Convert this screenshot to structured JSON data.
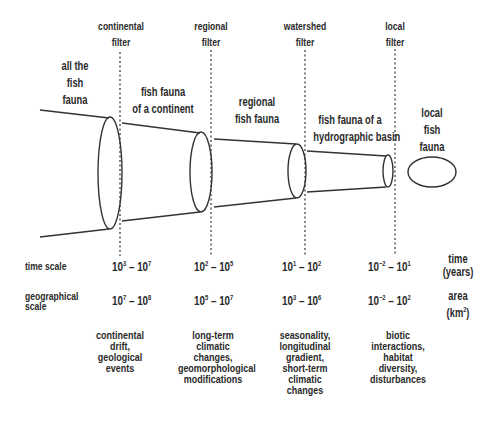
{
  "filters": [
    {
      "id": "continental",
      "label_line1": "continental",
      "label_line2": "filter"
    },
    {
      "id": "regional",
      "label_line1": "regional",
      "label_line2": "filter"
    },
    {
      "id": "watershed",
      "label_line1": "watershed",
      "label_line2": "filter"
    },
    {
      "id": "local",
      "label_line1": "local",
      "label_line2": "filter"
    }
  ],
  "faunas": [
    {
      "lines": [
        "all the",
        "fish",
        "fauna"
      ]
    },
    {
      "lines": [
        "fish fauna",
        "of a continent"
      ]
    },
    {
      "lines": [
        "regional",
        "fish fauna"
      ]
    },
    {
      "lines": [
        "fish fauna of a",
        "hydrographic basin"
      ]
    },
    {
      "lines": [
        "local",
        "fish",
        "fauna"
      ]
    }
  ],
  "rows": {
    "time_scale": {
      "label": "time scale",
      "unit_line1": "time",
      "unit_line2": "(years)",
      "values": [
        {
          "a_base": "10",
          "a_exp": "3",
          "b_base": "10",
          "b_exp": "7"
        },
        {
          "a_base": "10",
          "a_exp": "2",
          "b_base": "10",
          "b_exp": "5"
        },
        {
          "a_base": "10",
          "a_exp": "1",
          "b_base": "10",
          "b_exp": "2"
        },
        {
          "a_base": "10",
          "a_exp": "−2",
          "b_base": "10",
          "b_exp": "1"
        }
      ]
    },
    "geographical_scale": {
      "label_line1": "geographical",
      "label_line2": "scale",
      "unit_line1": "area",
      "unit_line2": "(km",
      "unit_exp": "2",
      "unit_close": ")",
      "values": [
        {
          "a_base": "10",
          "a_exp": "7",
          "b_base": "10",
          "b_exp": "8"
        },
        {
          "a_base": "10",
          "a_exp": "5",
          "b_base": "10",
          "b_exp": "7"
        },
        {
          "a_base": "10",
          "a_exp": "3",
          "b_base": "10",
          "b_exp": "6"
        },
        {
          "a_base": "10",
          "a_exp": "−2",
          "b_base": "10",
          "b_exp": "2"
        }
      ]
    }
  },
  "drivers": [
    {
      "lines": [
        "continental",
        "drift,",
        "geological",
        "events"
      ]
    },
    {
      "lines": [
        "long-term",
        "climatic",
        "changes,",
        "geomorphological",
        "modifications"
      ]
    },
    {
      "lines": [
        "seasonality,",
        "longitudinal",
        "gradient,",
        "short-term",
        "climatic",
        "changes"
      ]
    },
    {
      "lines": [
        "biotic",
        "interactions,",
        "habitat",
        "diversity,",
        "disturbances"
      ]
    }
  ],
  "dash": "–"
}
